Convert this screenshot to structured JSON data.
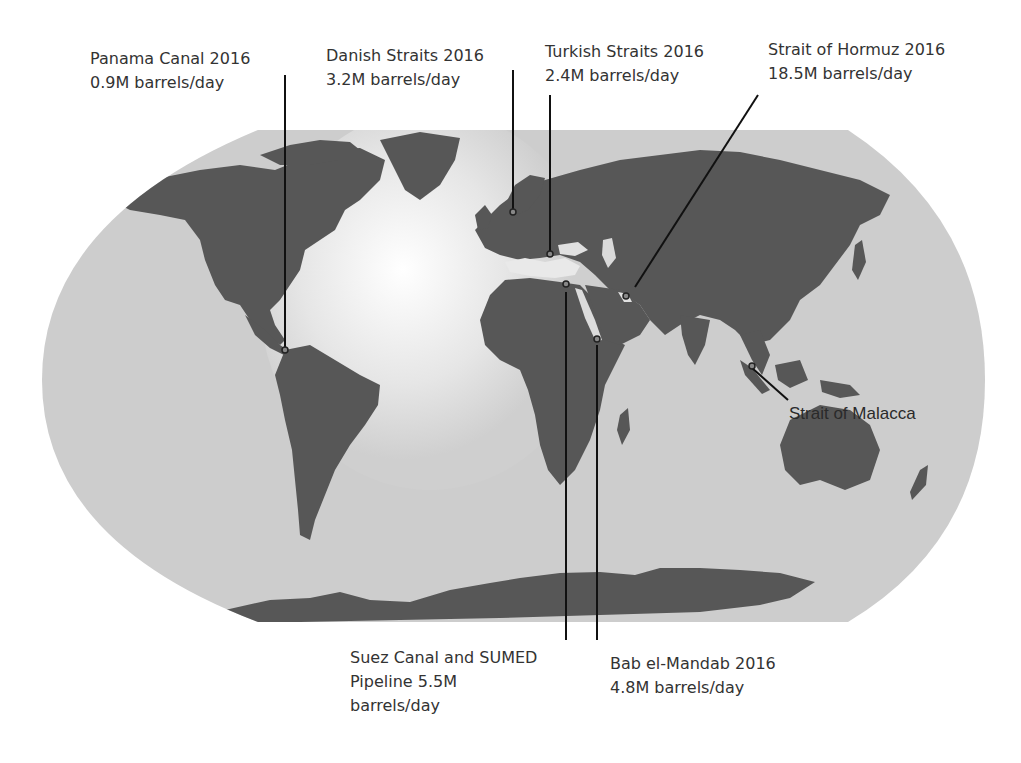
{
  "map": {
    "title": "World oil transit chokepoints",
    "projection": "Robinson-like world map",
    "colors": {
      "ocean": "#cbcbcb",
      "land": "#575757",
      "atlantic_highlight": "#f2f2f2",
      "leader_line": "#111111",
      "text": "#333333"
    }
  },
  "chokepoints": [
    {
      "id": "panama",
      "line1": "Panama Canal 2016",
      "line2": "0.9M barrels/day",
      "value_mbd": 0.9,
      "year": 2016
    },
    {
      "id": "danish",
      "line1": "Danish Straits 2016",
      "line2": "3.2M barrels/day",
      "value_mbd": 3.2,
      "year": 2016
    },
    {
      "id": "turkish",
      "line1": "Turkish Straits 2016",
      "line2": "2.4M barrels/day",
      "value_mbd": 2.4,
      "year": 2016
    },
    {
      "id": "hormuz",
      "line1": "Strait of Hormuz 2016",
      "line2": "18.5M barrels/day",
      "value_mbd": 18.5,
      "year": 2016
    },
    {
      "id": "suez",
      "line1": "Suez Canal and SUMED",
      "line2": "Pipeline 5.5M",
      "line3": "barrels/day",
      "value_mbd": 5.5
    },
    {
      "id": "bab",
      "line1": "Bab el-Mandab 2016",
      "line2": "4.8M barrels/day",
      "value_mbd": 4.8,
      "year": 2016
    },
    {
      "id": "malacca",
      "line1": "Strait of Malacca"
    }
  ]
}
